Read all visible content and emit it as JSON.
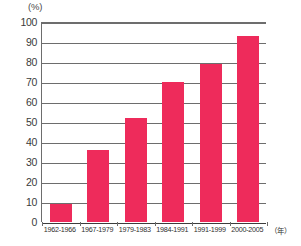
{
  "chart_data": {
    "type": "bar",
    "title": "",
    "subtitle": "",
    "xlabel": "（年）",
    "ylabel": "(%)",
    "categories": [
      "1962-1966",
      "1967-1979",
      "1979-1983",
      "1984-1991",
      "1991-1999",
      "2000-2005"
    ],
    "values": [
      9,
      36,
      52,
      70,
      79,
      93
    ],
    "ylim": [
      0,
      100
    ],
    "ytick_labels": [
      "100",
      "90",
      "80",
      "70",
      "60",
      "50",
      "40",
      "30",
      "20",
      "10",
      "0"
    ],
    "ytick_values": [
      100,
      90,
      80,
      70,
      60,
      50,
      40,
      30,
      20,
      10,
      0
    ],
    "grid": true,
    "legend": "none",
    "series": [
      {
        "name": "",
        "values": [
          9,
          36,
          52,
          70,
          79,
          93
        ],
        "color": "#ee2b5b"
      }
    ]
  },
  "axes": {
    "y_unit_label": "(%)",
    "x_unit_label": "（年）"
  },
  "colors": {
    "bar": "#ee2b5b",
    "grid": "#6d6d6d",
    "axis": "#3c3c3c",
    "text": "#2f2f2f",
    "background": "#ffffff"
  }
}
